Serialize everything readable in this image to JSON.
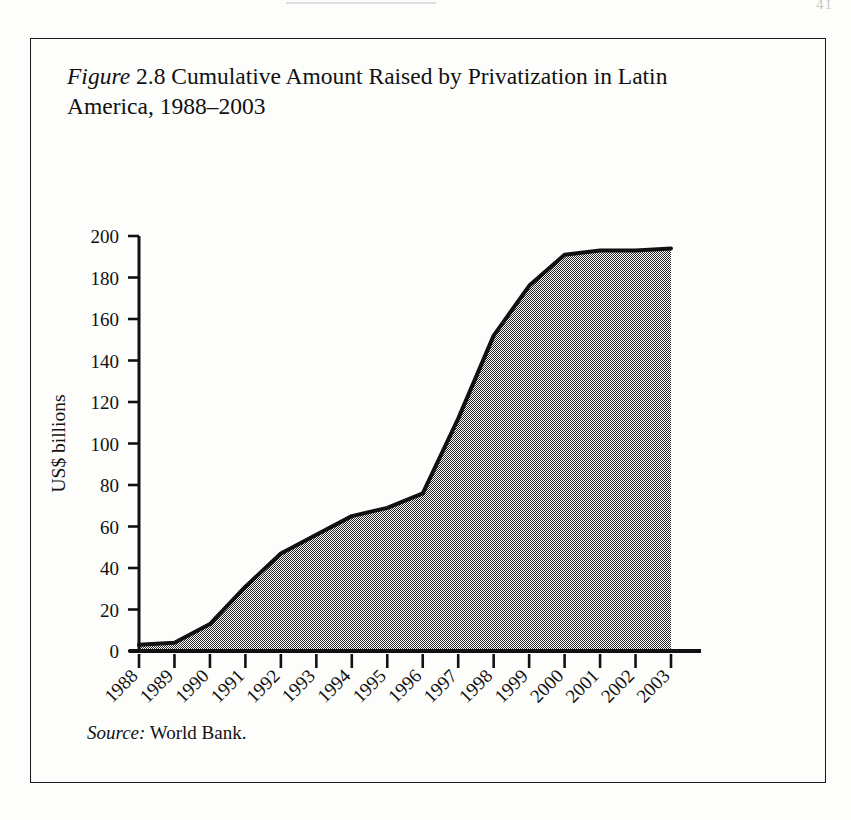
{
  "page": {
    "number": "41"
  },
  "figure": {
    "label": "Figure",
    "number": "2.8",
    "title_rest": " Cumulative Amount Raised by Privatization in Latin America, 1988–2003",
    "full_title": "Figure 2.8 Cumulative Amount Raised by Privatization in Latin America, 1988–2003",
    "source_label": "Source:",
    "source_text": " World Bank."
  },
  "colors": {
    "fill": "#808080",
    "line": "#111111",
    "axis": "#111111",
    "background": "#fdfdfb",
    "frame": "#1a1a1a"
  },
  "chart_data": {
    "type": "area",
    "title": "Cumulative Amount Raised by Privatization in Latin America, 1988–2003",
    "xlabel": "",
    "ylabel": "US$ billions",
    "categories": [
      "1988",
      "1989",
      "1990",
      "1991",
      "1992",
      "1993",
      "1994",
      "1995",
      "1996",
      "1997",
      "1998",
      "1999",
      "2000",
      "2001",
      "2002",
      "2003"
    ],
    "values": [
      3,
      4,
      13,
      31,
      47,
      56,
      65,
      69,
      76,
      112,
      152,
      176,
      191,
      193,
      193,
      194
    ],
    "series": [
      {
        "name": "Cumulative amount raised",
        "values": [
          3,
          4,
          13,
          31,
          47,
          56,
          65,
          69,
          76,
          112,
          152,
          176,
          191,
          193,
          193,
          194
        ]
      }
    ],
    "ylim": [
      0,
      200
    ],
    "ytick_values": [
      0,
      20,
      40,
      60,
      80,
      100,
      120,
      140,
      160,
      180,
      200
    ],
    "ytick_labels": [
      "0",
      "20",
      "40",
      "60",
      "80",
      "100",
      "120",
      "140",
      "160",
      "180",
      "200"
    ],
    "xtick_labels": [
      "1988",
      "1989",
      "1990",
      "1991",
      "1992",
      "1993",
      "1994",
      "1995",
      "1996",
      "1997",
      "1998",
      "1999",
      "2000",
      "2001",
      "2002",
      "2003"
    ],
    "xtick_rotation": 45,
    "grid": false,
    "legend": false,
    "legend_position": "none",
    "units": "US$ billions",
    "source": "World Bank."
  }
}
